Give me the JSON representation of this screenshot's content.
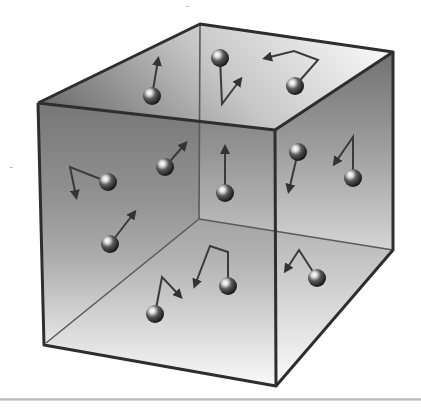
{
  "figure": {
    "colors": {
      "background": "#ffffff",
      "edge": "#2e2e2e",
      "inner_edge": "#5a5a5a",
      "face_dark": "#6a6a6a",
      "face_light": "#f4f4f4",
      "particle_dark": "#1c1c1c",
      "particle_highlight": "#f2f2f2",
      "arrow": "#3a3a3a"
    },
    "box": {
      "front_face": [
        [
          38,
          103
        ],
        [
          275,
          130
        ],
        [
          276,
          386
        ],
        [
          44,
          345
        ]
      ],
      "top_face": [
        [
          38,
          103
        ],
        [
          200,
          24
        ],
        [
          393,
          52
        ],
        [
          275,
          130
        ]
      ],
      "right_face": [
        [
          275,
          130
        ],
        [
          393,
          52
        ],
        [
          393,
          250
        ],
        [
          276,
          386
        ]
      ],
      "inner_back_vertex": [
        199,
        219
      ],
      "inner_edges": [
        [
          [
            200,
            24
          ],
          [
            199,
            219
          ]
        ],
        [
          [
            199,
            219
          ],
          [
            393,
            250
          ]
        ],
        [
          [
            199,
            219
          ],
          [
            46,
            343
          ]
        ]
      ]
    },
    "particles": [
      {
        "id": "p1",
        "x": 152,
        "y": 96,
        "arrow": [
          [
            152,
            96
          ],
          [
            158,
            60
          ]
        ],
        "bend": null
      },
      {
        "id": "p2",
        "x": 220,
        "y": 58,
        "arrow": [
          [
            220,
            58
          ],
          [
            222,
            104
          ],
          [
            240,
            80
          ]
        ],
        "bend": true
      },
      {
        "id": "p3",
        "x": 295,
        "y": 86,
        "arrow": [
          [
            295,
            86
          ],
          [
            318,
            60
          ],
          [
            294,
            51
          ],
          [
            266,
            58
          ]
        ],
        "bend": true
      },
      {
        "id": "p4",
        "x": 108,
        "y": 182,
        "arrow": [
          [
            108,
            182
          ],
          [
            70,
            167
          ],
          [
            76,
            196
          ]
        ],
        "bend": true
      },
      {
        "id": "p5",
        "x": 165,
        "y": 167,
        "arrow": [
          [
            165,
            167
          ],
          [
            185,
            144
          ]
        ],
        "bend": null
      },
      {
        "id": "p6",
        "x": 225,
        "y": 193,
        "arrow": [
          [
            225,
            193
          ],
          [
            225,
            148
          ]
        ],
        "bend": null
      },
      {
        "id": "p7",
        "x": 298,
        "y": 152,
        "arrow": [
          [
            298,
            152
          ],
          [
            289,
            190
          ]
        ],
        "bend": null
      },
      {
        "id": "p8",
        "x": 353,
        "y": 178,
        "arrow": [
          [
            353,
            178
          ],
          [
            353,
            137
          ],
          [
            335,
            163
          ]
        ],
        "bend": true
      },
      {
        "id": "p9",
        "x": 110,
        "y": 244,
        "arrow": [
          [
            110,
            244
          ],
          [
            134,
            213
          ]
        ],
        "bend": null
      },
      {
        "id": "p10",
        "x": 228,
        "y": 286,
        "arrow": [
          [
            228,
            286
          ],
          [
            228,
            252
          ],
          [
            210,
            246
          ],
          [
            195,
            285
          ]
        ],
        "bend": true
      },
      {
        "id": "p11",
        "x": 317,
        "y": 278,
        "arrow": [
          [
            317,
            278
          ],
          [
            299,
            250
          ],
          [
            286,
            270
          ]
        ],
        "bend": true
      },
      {
        "id": "p12",
        "x": 155,
        "y": 314,
        "arrow": [
          [
            155,
            314
          ],
          [
            162,
            277
          ],
          [
            180,
            296
          ]
        ],
        "bend": true
      }
    ],
    "baseline_y": 399
  }
}
